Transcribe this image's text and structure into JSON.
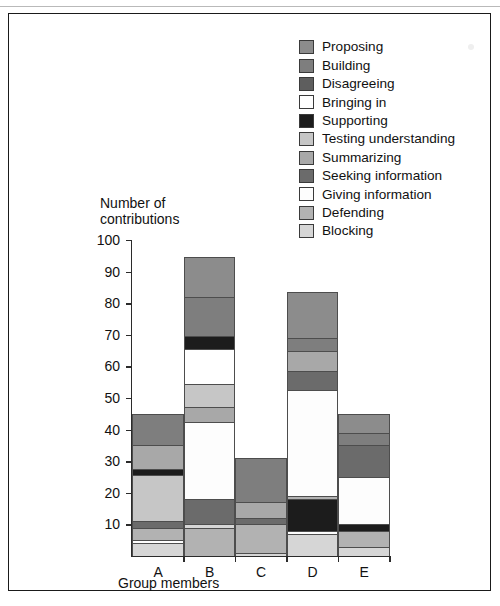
{
  "chart_data": {
    "type": "bar",
    "stacked": true,
    "title": "",
    "xlabel": "Group members",
    "ylabel": "Number of contributions",
    "ylim": [
      0,
      100
    ],
    "yticks": [
      10,
      20,
      30,
      40,
      50,
      60,
      70,
      80,
      90,
      100
    ],
    "grid": false,
    "legend_position": "top-right",
    "categories": [
      "A",
      "B",
      "C",
      "D",
      "E"
    ],
    "series": [
      {
        "name": "Proposing",
        "color": "#8c8c8c",
        "values": [
          0,
          12.5,
          0,
          14.5,
          6
        ]
      },
      {
        "name": "Building",
        "color": "#7e7e7e",
        "values": [
          10,
          12,
          14,
          0,
          4
        ]
      },
      {
        "name": "Disagreeing",
        "color": "#5e5e5e",
        "values": [
          0,
          0,
          0,
          0,
          0
        ]
      },
      {
        "name": "Bringing in",
        "color": "#ffffff",
        "values": [
          0,
          11,
          0,
          0,
          0
        ]
      },
      {
        "name": "Supporting",
        "color": "#1c1c1c",
        "values": [
          2,
          4,
          0,
          7,
          2
        ]
      },
      {
        "name": "Testing understanding",
        "color": "#c6c6c6",
        "values": [
          16,
          8,
          0,
          0,
          0
        ]
      },
      {
        "name": "Summarizing",
        "color": "#a8a8a8",
        "values": [
          6,
          4,
          5,
          4,
          0
        ]
      },
      {
        "name": "Seeking information",
        "color": "#6b6b6b",
        "values": [
          2,
          8,
          2,
          0,
          10
        ]
      },
      {
        "name": "Giving information",
        "color": "#fdfdfd",
        "values": [
          1,
          24.5,
          0,
          41,
          15
        ]
      },
      {
        "name": "Defending",
        "color": "#b2b2b2",
        "values": [
          4,
          9,
          9,
          10,
          5
        ]
      },
      {
        "name": "Blocking",
        "color": "#d6d6d6",
        "values": [
          4,
          1,
          1,
          7,
          3
        ]
      }
    ],
    "bar_totals": [
      45,
      94.5,
      31,
      83.5,
      45
    ],
    "stack_order": {
      "A": [
        {
          "name": "Blocking",
          "from": 0,
          "to": 4
        },
        {
          "name": "Giving information",
          "from": 4,
          "to": 5
        },
        {
          "name": "Defending",
          "from": 5,
          "to": 9
        },
        {
          "name": "Seeking information",
          "from": 9,
          "to": 11
        },
        {
          "name": "Testing understanding",
          "from": 11,
          "to": 25.5
        },
        {
          "name": "Supporting",
          "from": 25.5,
          "to": 27.5
        },
        {
          "name": "Summarizing",
          "from": 27.5,
          "to": 35
        },
        {
          "name": "Building",
          "from": 35,
          "to": 45
        }
      ],
      "B": [
        {
          "name": "Defending",
          "from": 0,
          "to": 9
        },
        {
          "name": "Blocking",
          "from": 9,
          "to": 10
        },
        {
          "name": "Seeking information",
          "from": 10,
          "to": 18
        },
        {
          "name": "Giving information",
          "from": 18,
          "to": 42.5
        },
        {
          "name": "Summarizing",
          "from": 42.5,
          "to": 47
        },
        {
          "name": "Testing understanding",
          "from": 47,
          "to": 54.5
        },
        {
          "name": "Bringing in",
          "from": 54.5,
          "to": 65.5
        },
        {
          "name": "Supporting",
          "from": 65.5,
          "to": 69.5
        },
        {
          "name": "Building",
          "from": 69.5,
          "to": 82
        },
        {
          "name": "Proposing",
          "from": 82,
          "to": 94.5
        }
      ],
      "C": [
        {
          "name": "Blocking",
          "from": 0,
          "to": 1
        },
        {
          "name": "Defending",
          "from": 1,
          "to": 10
        },
        {
          "name": "Seeking information",
          "from": 10,
          "to": 12
        },
        {
          "name": "Summarizing",
          "from": 12,
          "to": 17
        },
        {
          "name": "Building",
          "from": 17,
          "to": 31
        }
      ],
      "D": [
        {
          "name": "Blocking",
          "from": 0,
          "to": 7
        },
        {
          "name": "Giving information",
          "from": 7,
          "to": 8
        },
        {
          "name": "Supporting",
          "from": 8,
          "to": 18
        },
        {
          "name": "Defending",
          "from": 18,
          "to": 19
        },
        {
          "name": "Giving information",
          "from": 19,
          "to": 52.5
        },
        {
          "name": "Seeking information",
          "from": 52.5,
          "to": 58.5
        },
        {
          "name": "Summarizing",
          "from": 58.5,
          "to": 65
        },
        {
          "name": "Building",
          "from": 65,
          "to": 69
        },
        {
          "name": "Proposing",
          "from": 69,
          "to": 83.5
        }
      ],
      "E": [
        {
          "name": "Blocking",
          "from": 0,
          "to": 3
        },
        {
          "name": "Defending",
          "from": 3,
          "to": 8
        },
        {
          "name": "Supporting",
          "from": 8,
          "to": 10
        },
        {
          "name": "Giving information",
          "from": 10,
          "to": 25
        },
        {
          "name": "Seeking information",
          "from": 25,
          "to": 35
        },
        {
          "name": "Building",
          "from": 35,
          "to": 39
        },
        {
          "name": "Proposing",
          "from": 39,
          "to": 45
        }
      ]
    }
  },
  "legend": {
    "items": [
      {
        "label": "Proposing",
        "color": "#8c8c8c"
      },
      {
        "label": "Building",
        "color": "#7e7e7e"
      },
      {
        "label": "Disagreeing",
        "color": "#5e5e5e"
      },
      {
        "label": "Bringing in",
        "color": "#ffffff"
      },
      {
        "label": "Supporting",
        "color": "#1c1c1c"
      },
      {
        "label": "Testing understanding",
        "color": "#c6c6c6"
      },
      {
        "label": "Summarizing",
        "color": "#a8a8a8"
      },
      {
        "label": "Seeking information",
        "color": "#6b6b6b"
      },
      {
        "label": "Giving information",
        "color": "#fdfdfd"
      },
      {
        "label": "Defending",
        "color": "#b2b2b2"
      },
      {
        "label": "Blocking",
        "color": "#d6d6d6"
      }
    ]
  },
  "axis": {
    "y_title": "Number of\ncontributions",
    "x_title": "Group members"
  }
}
